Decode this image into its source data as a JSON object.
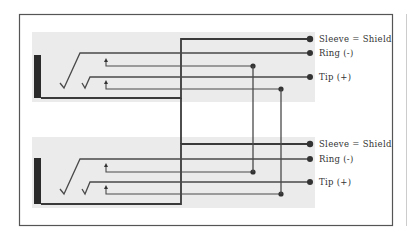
{
  "diagram": {
    "type": "wiring",
    "colors": {
      "background": "#ffffff",
      "panel": "#ebebeb",
      "line": "#4a4a4a",
      "sleeve_bar": "#2b2b2b",
      "frame": "#555555"
    },
    "jacks": [
      {
        "id": "top-jack",
        "labels": {
          "sleeve": "Sleeve = Shield",
          "ring": "Ring (-)",
          "tip": "Tip (+)"
        }
      },
      {
        "id": "bottom-jack",
        "labels": {
          "sleeve": "Sleeve = Shield",
          "ring": "Ring (-)",
          "tip": "Tip (+)"
        }
      }
    ]
  }
}
